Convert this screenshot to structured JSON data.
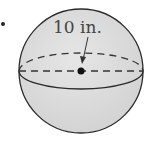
{
  "figure": {
    "shape": "sphere",
    "radius_label": "10 in.",
    "bullet": "•",
    "colors": {
      "fill": "#dcdcdc",
      "outline": "#2a2a2a",
      "text": "#444444",
      "background": "#ffffff"
    }
  }
}
